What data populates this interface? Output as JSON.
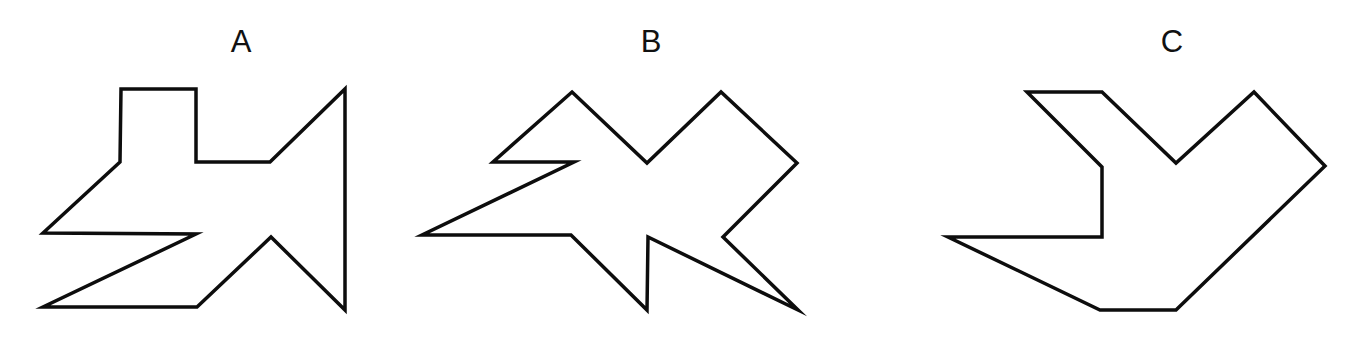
{
  "figures": [
    {
      "label": "A",
      "label_x": 241,
      "points": [
        [
          121,
          89
        ],
        [
          196,
          89
        ],
        [
          196,
          162
        ],
        [
          270,
          162
        ],
        [
          345,
          89
        ],
        [
          345,
          310
        ],
        [
          271,
          237
        ],
        [
          197,
          307
        ],
        [
          43,
          307
        ],
        [
          196,
          234
        ],
        [
          43,
          233
        ],
        [
          120,
          162
        ]
      ]
    },
    {
      "label": "B",
      "label_x": 651,
      "points": [
        [
          572,
          92
        ],
        [
          647,
          163
        ],
        [
          721,
          92
        ],
        [
          797,
          163
        ],
        [
          723,
          237
        ],
        [
          798,
          310
        ],
        [
          648,
          237
        ],
        [
          647,
          310
        ],
        [
          571,
          235
        ],
        [
          422,
          235
        ],
        [
          574,
          162
        ],
        [
          493,
          162
        ]
      ]
    },
    {
      "label": "C",
      "label_x": 1172,
      "points": [
        [
          1027,
          92
        ],
        [
          1102,
          92
        ],
        [
          1176,
          163
        ],
        [
          1254,
          92
        ],
        [
          1325,
          166
        ],
        [
          1176,
          310
        ],
        [
          1100,
          310
        ],
        [
          948,
          237
        ],
        [
          1102,
          237
        ],
        [
          1102,
          167
        ]
      ]
    }
  ],
  "colors": {
    "stroke": "#0d0d0d",
    "background": "#ffffff"
  }
}
